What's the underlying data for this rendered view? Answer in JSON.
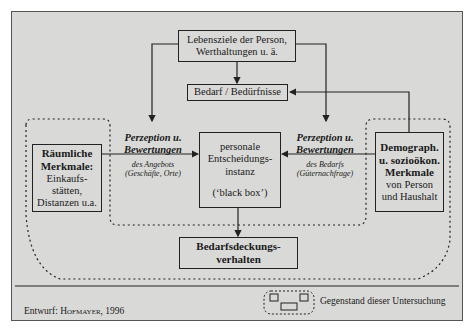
{
  "diagram": {
    "top_box": {
      "line1": "Lebensziele der Person,",
      "line2": "Werthaltungen u. ä."
    },
    "needs_box": {
      "label": "Bedarf / Bedürfnisse"
    },
    "spatial_box": {
      "title1": "Räumliche",
      "title2": "Merkmale:",
      "line1": "Einkaufs-",
      "line2": "stätten,",
      "line3": "Distanzen u.a."
    },
    "left_perception": {
      "title1": "Perzeption u.",
      "title2": "Bewertungen",
      "sub1": "des Angebots",
      "sub2": "(Geschäfte, Orte)"
    },
    "center_box": {
      "line1": "personale",
      "line2": "Entscheidungs-",
      "line3": "instanz",
      "line4": "(‘black box’)"
    },
    "right_perception": {
      "title1": "Perzeption u.",
      "title2": "Bewertungen",
      "sub1": "des Bedarfs",
      "sub2": "(Güternachfrage)"
    },
    "demo_box": {
      "title1": "Demograph.",
      "title2": "u. sozioökon.",
      "title3": "Merkmale",
      "line1": "von Person",
      "line2": "und Haushalt"
    },
    "outcome_box": {
      "line1": "Bedarfsdeckungs-",
      "line2": "verhalten"
    }
  },
  "footer": {
    "credit_prefix": "Entwurf: ",
    "credit_author": "Hofmayer",
    "credit_year": ", 1996",
    "legend_label": "Gegenstand dieser Untersuchung"
  },
  "colors": {
    "background": "#d9d9d7",
    "line": "#222222"
  }
}
